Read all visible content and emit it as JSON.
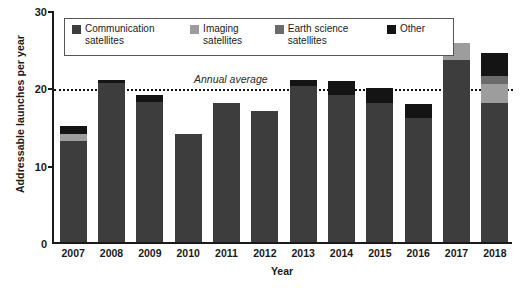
{
  "chart_data": {
    "type": "bar",
    "stacked": true,
    "title": "",
    "xlabel": "Year",
    "ylabel": "Addressable launches per year",
    "ylim": [
      0,
      30
    ],
    "yticks": [
      0,
      10,
      20,
      30
    ],
    "grid": false,
    "legend_position": "top-inside",
    "categories": [
      "2007",
      "2008",
      "2009",
      "2010",
      "2011",
      "2012",
      "2013",
      "2014",
      "2015",
      "2016",
      "2017",
      "2018"
    ],
    "series": [
      {
        "name": "Communication satellites",
        "color": "#3d3d3d",
        "values": [
          13.0,
          20.6,
          18.1,
          14.0,
          18.0,
          17.0,
          20.2,
          19.0,
          18.0,
          16.0,
          23.5,
          18.0
        ]
      },
      {
        "name": "Imaging satellites",
        "color": "#9d9d9d",
        "values": [
          1.0,
          0.0,
          0.0,
          0.0,
          0.0,
          0.0,
          0.0,
          0.0,
          0.0,
          0.0,
          2.2,
          2.4
        ]
      },
      {
        "name": "Earth science satellites",
        "color": "#6a6a6a",
        "values": [
          0.0,
          0.0,
          0.0,
          0.0,
          0.0,
          0.0,
          0.0,
          0.0,
          0.0,
          0.0,
          0.0,
          1.1
        ]
      },
      {
        "name": "Other",
        "color": "#141414",
        "values": [
          1.0,
          0.3,
          0.9,
          0.0,
          0.0,
          0.0,
          0.7,
          1.8,
          1.9,
          1.9,
          0.0,
          3.0
        ]
      }
    ],
    "totals": [
      15.0,
      20.9,
      19.0,
      14.0,
      18.0,
      17.0,
      20.9,
      20.8,
      19.9,
      17.9,
      25.7,
      24.5
    ],
    "annotations": [
      {
        "label": "Annual average",
        "type": "hline",
        "value": 20,
        "style": "dotted",
        "color": "#111111"
      }
    ]
  },
  "legend": {
    "entries": [
      {
        "label": "Communication\nsatellites",
        "swatch": "#3d3d3d"
      },
      {
        "label": "Imaging\nsatellites",
        "swatch": "#9d9d9d"
      },
      {
        "label": "Earth science\nsatellites",
        "swatch": "#6a6a6a"
      },
      {
        "label": "Other",
        "swatch": "#141414"
      }
    ]
  },
  "axis": {
    "y_tick_labels": [
      "0",
      "10",
      "20",
      "30"
    ],
    "x_tick_labels": [
      "2007",
      "2008",
      "2009",
      "2010",
      "2011",
      "2012",
      "2013",
      "2014",
      "2015",
      "2016",
      "2017",
      "2018"
    ]
  }
}
